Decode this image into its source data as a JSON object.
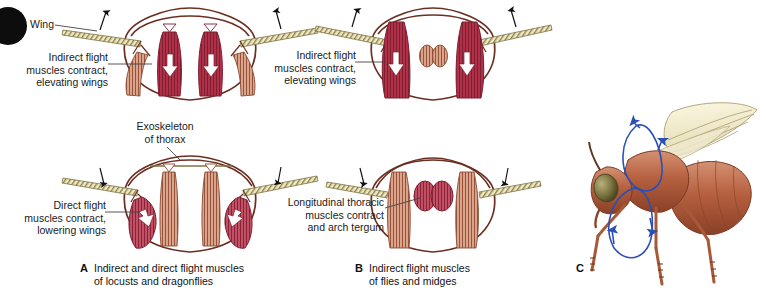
{
  "figure": {
    "title_hidden": "",
    "colors": {
      "muscle_red": "#b03048",
      "muscle_red_dark": "#8d2338",
      "muscle_pink": "#c85a6e",
      "thorax_outline": "#6b2f22",
      "wing_olive": "#a39a5c",
      "wing_fill": "#efe9c8",
      "arrow_white": "#ffffff",
      "arrow_black": "#111111",
      "fly_body": "#b5603f",
      "fly_wing": "#f2eccd",
      "path_blue": "#2a4fb5",
      "text": "#1a1a1a"
    }
  },
  "labels": {
    "wing": "Wing",
    "indirect_elevating_a": "Indirect flight\nmuscles contract,\nelevating wings",
    "exoskeleton": "Exoskeleton\nof thorax",
    "direct_lowering": "Direct flight\nmuscles contract,\nlowering wings",
    "indirect_elevating_b": "Indirect flight\nmuscles contract,\nelevating wings",
    "longitudinal": "Longitudinal thoracic\nmuscles contract\nand arch tergum"
  },
  "captions": {
    "a_letter": "A",
    "a_text": "Indirect and direct flight muscles\nof locusts and dragonflies",
    "b_letter": "B",
    "b_text": "Indirect flight muscles\nof flies and midges",
    "c_letter": "C"
  }
}
